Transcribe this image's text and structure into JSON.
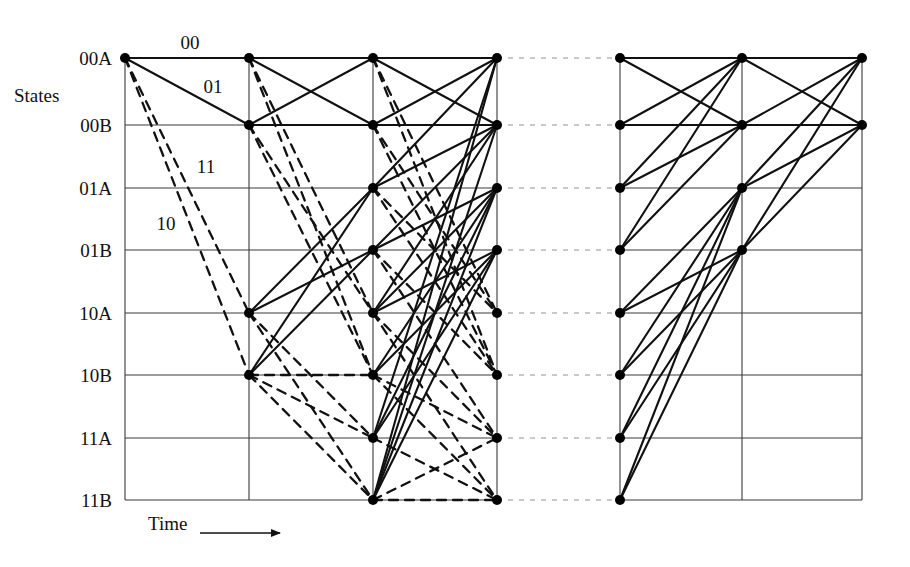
{
  "figure": {
    "type": "trellis-diagram",
    "axis_label": "States",
    "time_label": "Time",
    "background": "#ffffff",
    "line_color": "#111111",
    "grid_color": "#3a3a3a",
    "node_color": "#000000"
  },
  "states": [
    {
      "id": "00A",
      "label": "00A",
      "y": 58
    },
    {
      "id": "00B",
      "label": "00B",
      "y": 125
    },
    {
      "id": "01A",
      "label": "01A",
      "y": 188
    },
    {
      "id": "01B",
      "label": "01B",
      "y": 250
    },
    {
      "id": "10A",
      "label": "10A",
      "y": 313
    },
    {
      "id": "10B",
      "label": "10B",
      "y": 375
    },
    {
      "id": "11A",
      "label": "11A",
      "y": 438
    },
    {
      "id": "11B",
      "label": "11B",
      "y": 500
    }
  ],
  "columns": [
    {
      "index": 0,
      "x": 125,
      "panel": "left"
    },
    {
      "index": 1,
      "x": 249,
      "panel": "left"
    },
    {
      "index": 2,
      "x": 373,
      "panel": "left"
    },
    {
      "index": 3,
      "x": 497,
      "panel": "left"
    },
    {
      "index": 4,
      "x": 620,
      "panel": "right"
    },
    {
      "index": 5,
      "x": 742,
      "panel": "right"
    },
    {
      "index": 6,
      "x": 862,
      "panel": "right"
    }
  ],
  "grid": {
    "left_x": 125,
    "right_x": 862,
    "top_y": 58,
    "bottom_y": 500,
    "gap_from_x": 497,
    "gap_to_x": 620
  },
  "branch_labels": [
    {
      "text": "00",
      "x": 190,
      "y": 42
    },
    {
      "text": "01",
      "x": 213,
      "y": 86
    },
    {
      "text": "11",
      "x": 206,
      "y": 166
    },
    {
      "text": "10",
      "x": 166,
      "y": 223
    }
  ],
  "axis": {
    "states_x": 80,
    "states_y": 95,
    "time_x": 148,
    "time_y": 524,
    "arrow_x1": 200,
    "arrow_x2": 280,
    "arrow_y": 533
  },
  "legend": {
    "solid_meaning": "input 0 branch",
    "dashed_meaning": "input 1 branch"
  },
  "chart_data": {
    "type": "diagram",
    "title": "",
    "nodes_left": [
      {
        "col": 0,
        "states": [
          "00A"
        ]
      },
      {
        "col": 1,
        "states": [
          "00A",
          "00B",
          "10A",
          "10B"
        ]
      },
      {
        "col": 2,
        "states": [
          "00A",
          "00B",
          "01A",
          "01B",
          "10A",
          "10B",
          "11A",
          "11B"
        ]
      },
      {
        "col": 3,
        "states": [
          "00A",
          "00B",
          "01A",
          "01B",
          "10A",
          "10B",
          "11A",
          "11B"
        ]
      }
    ],
    "nodes_right": [
      {
        "col": 4,
        "states": [
          "00A",
          "00B",
          "01A",
          "01B",
          "10A",
          "10B",
          "11A",
          "11B"
        ]
      },
      {
        "col": 5,
        "states": [
          "00A",
          "00B",
          "01A",
          "01B"
        ]
      },
      {
        "col": 6,
        "states": [
          "00A",
          "00B"
        ]
      }
    ],
    "edges_left": [
      {
        "c": 0,
        "from": "00A",
        "to": "00A",
        "style": "solid"
      },
      {
        "c": 0,
        "from": "00A",
        "to": "00B",
        "style": "solid"
      },
      {
        "c": 0,
        "from": "00A",
        "to": "10A",
        "style": "dashed"
      },
      {
        "c": 0,
        "from": "00A",
        "to": "10B",
        "style": "dashed"
      },
      {
        "c": 1,
        "from": "00A",
        "to": "00A",
        "style": "solid"
      },
      {
        "c": 1,
        "from": "00A",
        "to": "00B",
        "style": "solid"
      },
      {
        "c": 1,
        "from": "00A",
        "to": "10A",
        "style": "dashed"
      },
      {
        "c": 1,
        "from": "00A",
        "to": "10B",
        "style": "dashed"
      },
      {
        "c": 1,
        "from": "00B",
        "to": "00A",
        "style": "solid"
      },
      {
        "c": 1,
        "from": "00B",
        "to": "00B",
        "style": "solid"
      },
      {
        "c": 1,
        "from": "00B",
        "to": "10A",
        "style": "dashed"
      },
      {
        "c": 1,
        "from": "00B",
        "to": "10B",
        "style": "dashed"
      },
      {
        "c": 1,
        "from": "10A",
        "to": "01A",
        "style": "solid"
      },
      {
        "c": 1,
        "from": "10A",
        "to": "01B",
        "style": "solid"
      },
      {
        "c": 1,
        "from": "10A",
        "to": "11A",
        "style": "dashed"
      },
      {
        "c": 1,
        "from": "10A",
        "to": "11B",
        "style": "dashed"
      },
      {
        "c": 1,
        "from": "10B",
        "to": "01A",
        "style": "solid"
      },
      {
        "c": 1,
        "from": "10B",
        "to": "01B",
        "style": "solid"
      },
      {
        "c": 1,
        "from": "10B",
        "to": "10B",
        "style": "dashed"
      },
      {
        "c": 1,
        "from": "10B",
        "to": "11A",
        "style": "dashed"
      },
      {
        "c": 1,
        "from": "10B",
        "to": "11B",
        "style": "dashed"
      },
      {
        "c": 2,
        "from": "00A",
        "to": "00A",
        "style": "solid"
      },
      {
        "c": 2,
        "from": "00A",
        "to": "00B",
        "style": "solid"
      },
      {
        "c": 2,
        "from": "00A",
        "to": "10A",
        "style": "dashed"
      },
      {
        "c": 2,
        "from": "00A",
        "to": "10B",
        "style": "dashed"
      },
      {
        "c": 2,
        "from": "00B",
        "to": "00A",
        "style": "solid"
      },
      {
        "c": 2,
        "from": "00B",
        "to": "00B",
        "style": "solid"
      },
      {
        "c": 2,
        "from": "00B",
        "to": "10A",
        "style": "dashed"
      },
      {
        "c": 2,
        "from": "00B",
        "to": "10B",
        "style": "dashed"
      },
      {
        "c": 2,
        "from": "01A",
        "to": "00A",
        "style": "solid"
      },
      {
        "c": 2,
        "from": "01A",
        "to": "00B",
        "style": "solid"
      },
      {
        "c": 2,
        "from": "01A",
        "to": "10A",
        "style": "dashed"
      },
      {
        "c": 2,
        "from": "01A",
        "to": "10B",
        "style": "dashed"
      },
      {
        "c": 2,
        "from": "01B",
        "to": "00B",
        "style": "solid"
      },
      {
        "c": 2,
        "from": "01B",
        "to": "01A",
        "style": "solid"
      },
      {
        "c": 2,
        "from": "01B",
        "to": "10B",
        "style": "dashed"
      },
      {
        "c": 2,
        "from": "01B",
        "to": "11A",
        "style": "dashed"
      },
      {
        "c": 2,
        "from": "10A",
        "to": "00B",
        "style": "solid"
      },
      {
        "c": 2,
        "from": "10A",
        "to": "01A",
        "style": "solid"
      },
      {
        "c": 2,
        "from": "10A",
        "to": "01B",
        "style": "solid"
      },
      {
        "c": 2,
        "from": "10A",
        "to": "11A",
        "style": "dashed"
      },
      {
        "c": 2,
        "from": "10A",
        "to": "11B",
        "style": "dashed"
      },
      {
        "c": 2,
        "from": "10B",
        "to": "01A",
        "style": "solid"
      },
      {
        "c": 2,
        "from": "10B",
        "to": "01B",
        "style": "solid"
      },
      {
        "c": 2,
        "from": "10B",
        "to": "11A",
        "style": "dashed"
      },
      {
        "c": 2,
        "from": "10B",
        "to": "11B",
        "style": "dashed"
      },
      {
        "c": 2,
        "from": "11A",
        "to": "00A",
        "style": "solid"
      },
      {
        "c": 2,
        "from": "11A",
        "to": "01A",
        "style": "solid"
      },
      {
        "c": 2,
        "from": "11A",
        "to": "01B",
        "style": "solid"
      },
      {
        "c": 2,
        "from": "11A",
        "to": "11B",
        "style": "dashed"
      },
      {
        "c": 2,
        "from": "11B",
        "to": "00A",
        "style": "solid"
      },
      {
        "c": 2,
        "from": "11B",
        "to": "00B",
        "style": "solid"
      },
      {
        "c": 2,
        "from": "11B",
        "to": "01A",
        "style": "solid"
      },
      {
        "c": 2,
        "from": "11B",
        "to": "01B",
        "style": "solid"
      },
      {
        "c": 2,
        "from": "11B",
        "to": "11A",
        "style": "dashed"
      },
      {
        "c": 2,
        "from": "11B",
        "to": "11B",
        "style": "dashed"
      }
    ],
    "edges_right": [
      {
        "c": 4,
        "from": "00A",
        "to": "00A",
        "style": "solid"
      },
      {
        "c": 4,
        "from": "00A",
        "to": "00B",
        "style": "solid"
      },
      {
        "c": 4,
        "from": "00B",
        "to": "00A",
        "style": "solid"
      },
      {
        "c": 4,
        "from": "00B",
        "to": "00B",
        "style": "solid"
      },
      {
        "c": 4,
        "from": "01A",
        "to": "00A",
        "style": "solid"
      },
      {
        "c": 4,
        "from": "01A",
        "to": "00B",
        "style": "solid"
      },
      {
        "c": 4,
        "from": "01B",
        "to": "00A",
        "style": "solid"
      },
      {
        "c": 4,
        "from": "01B",
        "to": "00B",
        "style": "solid"
      },
      {
        "c": 4,
        "from": "10A",
        "to": "01A",
        "style": "solid"
      },
      {
        "c": 4,
        "from": "10A",
        "to": "01B",
        "style": "solid"
      },
      {
        "c": 4,
        "from": "10B",
        "to": "01A",
        "style": "solid"
      },
      {
        "c": 4,
        "from": "10B",
        "to": "01B",
        "style": "solid"
      },
      {
        "c": 4,
        "from": "11A",
        "to": "01A",
        "style": "solid"
      },
      {
        "c": 4,
        "from": "11A",
        "to": "01B",
        "style": "solid"
      },
      {
        "c": 4,
        "from": "11B",
        "to": "01A",
        "style": "solid"
      },
      {
        "c": 4,
        "from": "11B",
        "to": "01B",
        "style": "solid"
      },
      {
        "c": 5,
        "from": "00A",
        "to": "00A",
        "style": "solid"
      },
      {
        "c": 5,
        "from": "00A",
        "to": "00B",
        "style": "solid"
      },
      {
        "c": 5,
        "from": "00B",
        "to": "00A",
        "style": "solid"
      },
      {
        "c": 5,
        "from": "00B",
        "to": "00B",
        "style": "solid"
      },
      {
        "c": 5,
        "from": "01A",
        "to": "00A",
        "style": "solid"
      },
      {
        "c": 5,
        "from": "01A",
        "to": "00B",
        "style": "solid"
      },
      {
        "c": 5,
        "from": "01B",
        "to": "00A",
        "style": "solid"
      },
      {
        "c": 5,
        "from": "01B",
        "to": "00B",
        "style": "solid"
      }
    ]
  }
}
